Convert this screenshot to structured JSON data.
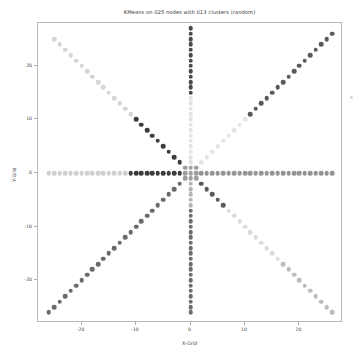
{
  "chart_data": {
    "type": "scatter",
    "title": "KMeans on 025 nodes with 013 clusters (random)",
    "xlabel": "X-Grid",
    "ylabel": "Y-Grid",
    "xlim": [
      -28,
      28
    ],
    "ylim": [
      -28,
      28
    ],
    "xticks": [
      -20,
      -10,
      0,
      10,
      20
    ],
    "yticks": [
      -20,
      -10,
      0,
      10,
      20
    ],
    "xtick_labels": [
      "-20",
      "-10",
      "0",
      "10",
      "20"
    ],
    "ytick_labels": [
      "-20",
      "-10",
      "0",
      "10",
      "20"
    ],
    "grid": false,
    "legend": false,
    "colormap": "grayscale",
    "n_nodes": 25,
    "n_clusters": 13,
    "marker_size": 4.6,
    "series": [
      {
        "name": "arm-west",
        "angle_deg": 180,
        "color": "#d0d0d0",
        "points": [
          {
            "x": -26,
            "y": 0
          },
          {
            "x": -25,
            "y": 0
          },
          {
            "x": -24,
            "y": 0
          },
          {
            "x": -23,
            "y": 0
          },
          {
            "x": -22,
            "y": 0
          },
          {
            "x": -21,
            "y": 0
          },
          {
            "x": -20,
            "y": 0
          },
          {
            "x": -19,
            "y": 0
          },
          {
            "x": -18,
            "y": 0
          },
          {
            "x": -17,
            "y": 0
          },
          {
            "x": -16,
            "y": 0
          },
          {
            "x": -15,
            "y": 0
          },
          {
            "x": -14,
            "y": 0
          },
          {
            "x": -13,
            "y": 0
          },
          {
            "x": -12,
            "y": 0
          }
        ]
      },
      {
        "name": "arm-west-inner",
        "angle_deg": 180,
        "color": "#3c3c3c",
        "points": [
          {
            "x": -11,
            "y": 0
          },
          {
            "x": -10,
            "y": 0
          },
          {
            "x": -9,
            "y": 0
          },
          {
            "x": -8,
            "y": 0
          },
          {
            "x": -7,
            "y": 0
          },
          {
            "x": -6,
            "y": 0
          },
          {
            "x": -5,
            "y": 0
          },
          {
            "x": -4,
            "y": 0
          },
          {
            "x": -3,
            "y": 0
          },
          {
            "x": -2,
            "y": 0
          }
        ]
      },
      {
        "name": "arm-east",
        "angle_deg": 0,
        "color": "#949494",
        "points": [
          {
            "x": 2,
            "y": 0
          },
          {
            "x": 3,
            "y": 0
          },
          {
            "x": 4,
            "y": 0
          },
          {
            "x": 5,
            "y": 0
          },
          {
            "x": 6,
            "y": 0
          },
          {
            "x": 7,
            "y": 0
          },
          {
            "x": 8,
            "y": 0
          },
          {
            "x": 9,
            "y": 0
          },
          {
            "x": 10,
            "y": 0
          },
          {
            "x": 11,
            "y": 0
          },
          {
            "x": 12,
            "y": 0
          },
          {
            "x": 13,
            "y": 0
          },
          {
            "x": 14,
            "y": 0
          },
          {
            "x": 15,
            "y": 0
          },
          {
            "x": 16,
            "y": 0
          },
          {
            "x": 17,
            "y": 0
          },
          {
            "x": 18,
            "y": 0
          },
          {
            "x": 19,
            "y": 0
          },
          {
            "x": 20,
            "y": 0
          },
          {
            "x": 21,
            "y": 0
          },
          {
            "x": 22,
            "y": 0
          },
          {
            "x": 23,
            "y": 0
          },
          {
            "x": 24,
            "y": 0
          },
          {
            "x": 25,
            "y": 0
          },
          {
            "x": 26,
            "y": 0
          }
        ]
      },
      {
        "name": "arm-north-outer",
        "angle_deg": 90,
        "color": "#4a4a4a",
        "points": [
          {
            "x": 0,
            "y": 27
          },
          {
            "x": 0,
            "y": 26
          },
          {
            "x": 0,
            "y": 25
          },
          {
            "x": 0,
            "y": 24
          },
          {
            "x": 0,
            "y": 23
          },
          {
            "x": 0,
            "y": 22
          },
          {
            "x": 0,
            "y": 21
          },
          {
            "x": 0,
            "y": 20
          },
          {
            "x": 0,
            "y": 19
          },
          {
            "x": 0,
            "y": 18
          },
          {
            "x": 0,
            "y": 17
          },
          {
            "x": 0,
            "y": 16
          },
          {
            "x": 0,
            "y": 15
          }
        ]
      },
      {
        "name": "arm-north-inner",
        "angle_deg": 90,
        "color": "#e3e3e3",
        "points": [
          {
            "x": 0,
            "y": 14
          },
          {
            "x": 0,
            "y": 13
          },
          {
            "x": 0,
            "y": 12
          },
          {
            "x": 0,
            "y": 11
          },
          {
            "x": 0,
            "y": 10
          },
          {
            "x": 0,
            "y": 9
          },
          {
            "x": 0,
            "y": 8
          },
          {
            "x": 0,
            "y": 7
          },
          {
            "x": 0,
            "y": 6
          },
          {
            "x": 0,
            "y": 5
          },
          {
            "x": 0,
            "y": 4
          },
          {
            "x": 0,
            "y": 3
          },
          {
            "x": 0,
            "y": 2
          }
        ]
      },
      {
        "name": "arm-south-inner",
        "angle_deg": 270,
        "color": "#b4b4b4",
        "points": [
          {
            "x": 0,
            "y": -2
          },
          {
            "x": 0,
            "y": -3
          },
          {
            "x": 0,
            "y": -4
          },
          {
            "x": 0,
            "y": -5
          },
          {
            "x": 0,
            "y": -6
          }
        ]
      },
      {
        "name": "arm-south-outer",
        "angle_deg": 270,
        "color": "#6e6e6e",
        "points": [
          {
            "x": 0,
            "y": -7
          },
          {
            "x": 0,
            "y": -8
          },
          {
            "x": 0,
            "y": -9
          },
          {
            "x": 0,
            "y": -10
          },
          {
            "x": 0,
            "y": -11
          },
          {
            "x": 0,
            "y": -12
          },
          {
            "x": 0,
            "y": -13
          },
          {
            "x": 0,
            "y": -14
          },
          {
            "x": 0,
            "y": -15
          },
          {
            "x": 0,
            "y": -16
          },
          {
            "x": 0,
            "y": -17
          },
          {
            "x": 0,
            "y": -18
          },
          {
            "x": 0,
            "y": -19
          },
          {
            "x": 0,
            "y": -20
          },
          {
            "x": 0,
            "y": -21
          },
          {
            "x": 0,
            "y": -22
          },
          {
            "x": 0,
            "y": -23
          },
          {
            "x": 0,
            "y": -24
          },
          {
            "x": 0,
            "y": -25
          },
          {
            "x": 0,
            "y": -26
          }
        ]
      },
      {
        "name": "arm-northwest-outer",
        "angle_deg": 135,
        "color": "#d6d6d6",
        "points": [
          {
            "x": -25,
            "y": 25
          },
          {
            "x": -24,
            "y": 24
          },
          {
            "x": -23,
            "y": 23
          },
          {
            "x": -22,
            "y": 22
          },
          {
            "x": -21,
            "y": 21
          },
          {
            "x": -20,
            "y": 20
          },
          {
            "x": -19,
            "y": 19
          },
          {
            "x": -18,
            "y": 18
          },
          {
            "x": -17,
            "y": 17
          },
          {
            "x": -16,
            "y": 16
          },
          {
            "x": -15,
            "y": 15
          },
          {
            "x": -14,
            "y": 14
          },
          {
            "x": -13,
            "y": 13
          },
          {
            "x": -12,
            "y": 12
          },
          {
            "x": -11,
            "y": 11
          }
        ]
      },
      {
        "name": "arm-northwest-inner",
        "angle_deg": 135,
        "color": "#3c3c3c",
        "points": [
          {
            "x": -10,
            "y": 10
          },
          {
            "x": -9,
            "y": 9
          },
          {
            "x": -8,
            "y": 8
          },
          {
            "x": -7,
            "y": 7
          },
          {
            "x": -6,
            "y": 6
          },
          {
            "x": -5,
            "y": 5
          },
          {
            "x": -4,
            "y": 4
          },
          {
            "x": -3,
            "y": 3
          },
          {
            "x": -2,
            "y": 2
          }
        ]
      },
      {
        "name": "arm-northeast-inner",
        "angle_deg": 45,
        "color": "#e6e6e6",
        "points": [
          {
            "x": 2,
            "y": 2
          },
          {
            "x": 3,
            "y": 3
          },
          {
            "x": 4,
            "y": 4
          },
          {
            "x": 5,
            "y": 5
          },
          {
            "x": 6,
            "y": 6
          },
          {
            "x": 7,
            "y": 7
          },
          {
            "x": 8,
            "y": 8
          },
          {
            "x": 9,
            "y": 9
          },
          {
            "x": 10,
            "y": 10
          }
        ]
      },
      {
        "name": "arm-northeast-outer",
        "angle_deg": 45,
        "color": "#5a5a5a",
        "points": [
          {
            "x": 11,
            "y": 11
          },
          {
            "x": 12,
            "y": 12
          },
          {
            "x": 13,
            "y": 13
          },
          {
            "x": 14,
            "y": 14
          },
          {
            "x": 15,
            "y": 15
          },
          {
            "x": 16,
            "y": 16
          },
          {
            "x": 17,
            "y": 17
          },
          {
            "x": 18,
            "y": 18
          },
          {
            "x": 19,
            "y": 19
          },
          {
            "x": 20,
            "y": 20
          },
          {
            "x": 21,
            "y": 21
          },
          {
            "x": 22,
            "y": 22
          },
          {
            "x": 23,
            "y": 23
          },
          {
            "x": 24,
            "y": 24
          },
          {
            "x": 25,
            "y": 25
          },
          {
            "x": 26,
            "y": 26
          }
        ]
      },
      {
        "name": "arm-southwest",
        "angle_deg": 225,
        "color": "#6a6a6a",
        "points": [
          {
            "x": -2,
            "y": -2
          },
          {
            "x": -3,
            "y": -3
          },
          {
            "x": -4,
            "y": -4
          },
          {
            "x": -5,
            "y": -5
          },
          {
            "x": -6,
            "y": -6
          },
          {
            "x": -7,
            "y": -7
          },
          {
            "x": -8,
            "y": -8
          },
          {
            "x": -9,
            "y": -9
          },
          {
            "x": -10,
            "y": -10
          },
          {
            "x": -11,
            "y": -11
          },
          {
            "x": -12,
            "y": -12
          },
          {
            "x": -13,
            "y": -13
          },
          {
            "x": -14,
            "y": -14
          },
          {
            "x": -15,
            "y": -15
          },
          {
            "x": -16,
            "y": -16
          },
          {
            "x": -17,
            "y": -17
          },
          {
            "x": -18,
            "y": -18
          },
          {
            "x": -19,
            "y": -19
          },
          {
            "x": -20,
            "y": -20
          },
          {
            "x": -21,
            "y": -21
          },
          {
            "x": -22,
            "y": -22
          },
          {
            "x": -23,
            "y": -23
          },
          {
            "x": -24,
            "y": -24
          },
          {
            "x": -25,
            "y": -25
          },
          {
            "x": -26,
            "y": -26
          }
        ]
      },
      {
        "name": "arm-southeast-inner",
        "angle_deg": 315,
        "color": "#5a5a5a",
        "points": [
          {
            "x": 2,
            "y": -2
          },
          {
            "x": 3,
            "y": -3
          },
          {
            "x": 4,
            "y": -4
          },
          {
            "x": 5,
            "y": -5
          },
          {
            "x": 6,
            "y": -6
          }
        ]
      },
      {
        "name": "arm-southeast-mid",
        "angle_deg": 315,
        "color": "#dcdcdc",
        "points": [
          {
            "x": 7,
            "y": -7
          },
          {
            "x": 8,
            "y": -8
          },
          {
            "x": 9,
            "y": -9
          },
          {
            "x": 10,
            "y": -10
          },
          {
            "x": 11,
            "y": -11
          },
          {
            "x": 12,
            "y": -12
          },
          {
            "x": 13,
            "y": -13
          },
          {
            "x": 14,
            "y": -14
          },
          {
            "x": 15,
            "y": -15
          },
          {
            "x": 16,
            "y": -16
          }
        ]
      },
      {
        "name": "arm-southeast-outer",
        "angle_deg": 315,
        "color": "#bcbcbc",
        "points": [
          {
            "x": 17,
            "y": -17
          },
          {
            "x": 18,
            "y": -18
          },
          {
            "x": 19,
            "y": -19
          },
          {
            "x": 20,
            "y": -20
          },
          {
            "x": 21,
            "y": -21
          },
          {
            "x": 22,
            "y": -22
          },
          {
            "x": 23,
            "y": -23
          },
          {
            "x": 24,
            "y": -24
          },
          {
            "x": 25,
            "y": -25
          },
          {
            "x": 26,
            "y": -26
          }
        ]
      },
      {
        "name": "center-cluster",
        "angle_deg": null,
        "color": "#9e9e9e",
        "points": [
          {
            "x": 0,
            "y": 0
          },
          {
            "x": 1,
            "y": 0
          },
          {
            "x": -1,
            "y": 0
          },
          {
            "x": 0,
            "y": 1
          },
          {
            "x": 0,
            "y": -1
          },
          {
            "x": 1,
            "y": 1
          },
          {
            "x": -1,
            "y": -1
          },
          {
            "x": 1,
            "y": -1
          },
          {
            "x": -1,
            "y": 1
          }
        ]
      }
    ]
  }
}
